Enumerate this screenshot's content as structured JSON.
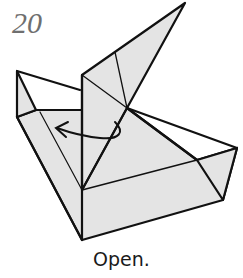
{
  "step": {
    "number": "20",
    "caption": "Open."
  },
  "diagram": {
    "fill_color": "#e4e4e4",
    "line_color": "#111111",
    "arrow": "curved open arrow pointing left"
  }
}
